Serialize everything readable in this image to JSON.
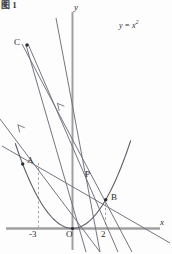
{
  "figure": {
    "caption": "图 1",
    "background_color": "#fdfdfd",
    "axis_color": "#9a9a9a",
    "curve_color": "#5a5a66",
    "line_color": "#6b6b76",
    "dash_color": "#9a9a9a",
    "text_color": "#2b2b2b",
    "width": 172,
    "height": 254
  },
  "axes": {
    "x_label": "x",
    "y_label": "y",
    "origin_label": "O",
    "tick_labels": [
      "-3",
      "2"
    ]
  },
  "curve": {
    "equation_label": "y = x",
    "equation_exponent": "2"
  },
  "points": [
    {
      "name": "C",
      "label": "C"
    },
    {
      "name": "A",
      "label": "A"
    },
    {
      "name": "P",
      "label": "P"
    },
    {
      "name": "B",
      "label": "B"
    },
    {
      "name": "O",
      "label": "O"
    }
  ],
  "chart_data": {
    "type": "line",
    "title": "图 1",
    "xlabel": "x",
    "ylabel": "y",
    "xlim": [
      -4.4,
      6.0
    ],
    "ylim": [
      -3.6,
      31.0
    ],
    "grid": false,
    "legend": "none",
    "annotations": [
      {
        "text": "y = x²",
        "x": 2.9,
        "y": 29.0
      },
      {
        "text": "C",
        "x": -2.9,
        "y": 25.5
      },
      {
        "text": "A",
        "x": -3.0,
        "y": 9.0
      },
      {
        "text": "P",
        "x": 1.0,
        "y": 6.6
      },
      {
        "text": "B",
        "x": 2.0,
        "y": 4.0
      },
      {
        "text": "O",
        "x": 0.0,
        "y": 0.0
      },
      {
        "text": "-3",
        "x": -3.0,
        "y": 0.0
      },
      {
        "text": "2",
        "x": 2.0,
        "y": 0.0
      }
    ],
    "series": [
      {
        "name": "parabola",
        "type": "parabola",
        "equation": "y = x^2",
        "x": [
          -3.3,
          -3.0,
          -2.5,
          -2.0,
          -1.5,
          -1.0,
          -0.5,
          0.0,
          0.5,
          1.0,
          1.5,
          2.0,
          2.5,
          3.0,
          3.4
        ],
        "values": [
          10.89,
          9.0,
          6.25,
          4.0,
          2.25,
          1.0,
          0.25,
          0.0,
          0.25,
          1.0,
          2.25,
          4.0,
          6.25,
          9.0,
          11.56
        ]
      },
      {
        "name": "line-AB",
        "type": "segment",
        "x": [
          -4.3,
          5.8
        ],
        "values": [
          11.3,
          -3.2
        ]
      },
      {
        "name": "line-C-to-lower-right",
        "type": "segment",
        "x": [
          -3.1,
          3.6
        ],
        "values": [
          25.8,
          -3.2
        ]
      },
      {
        "name": "line-C-through-O",
        "type": "segment",
        "x": [
          -3.05,
          0.85
        ],
        "values": [
          25.8,
          -3.4
        ]
      },
      {
        "name": "line-C-through-B",
        "type": "segment",
        "x": [
          -3.0,
          2.6
        ],
        "values": [
          25.9,
          -3.3
        ]
      },
      {
        "name": "line-A-to-B-extended",
        "type": "segment",
        "x": [
          -4.3,
          2.2
        ],
        "values": [
          4.4,
          -3.3
        ]
      },
      {
        "name": "line-steep-up-right",
        "type": "segment",
        "x": [
          -1.1,
          1.6
        ],
        "values": [
          27.0,
          -3.3
        ]
      }
    ]
  }
}
